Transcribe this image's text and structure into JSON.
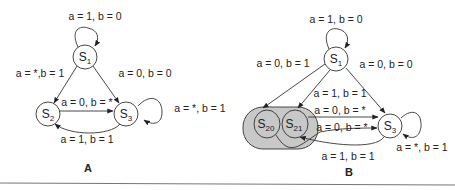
{
  "diagram_a": {
    "panel_label": "A",
    "nodes": {
      "s1": {
        "base": "S",
        "sub": "1"
      },
      "s2": {
        "base": "S",
        "sub": "2"
      },
      "s3": {
        "base": "S",
        "sub": "3"
      }
    },
    "edges": {
      "s1_self": "a = 1, b = 0",
      "s1_s2": "a = *,b = 1",
      "s1_s3": "a = 0, b = 0",
      "s2_s3": "a = 0, b = *",
      "s3_s2": "a = 1, b = 1",
      "s3_self": "a = *, b = 1"
    }
  },
  "diagram_b": {
    "panel_label": "B",
    "nodes": {
      "s1": {
        "base": "S",
        "sub": "1"
      },
      "s20": {
        "base": "S",
        "sub": "20"
      },
      "s21": {
        "base": "S",
        "sub": "21"
      },
      "s3": {
        "base": "S",
        "sub": "3"
      }
    },
    "edges": {
      "s1_self": "a = 1, b = 0",
      "s1_s20": "a = 0, b = 1",
      "s1_s21": "a = 1, b = 1",
      "s1_s3": "a = 0, b = 0",
      "s21_s3": "a = 0, b = *",
      "s20_s3": "a = 0, b = *",
      "s3_s21": "a = 1, b = 1",
      "s3_self": "a = *, b = 1"
    },
    "group_color": "#c8c8c8"
  }
}
